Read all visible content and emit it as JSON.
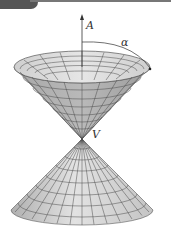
{
  "figure": {
    "labels": {
      "axis": "A",
      "angle": "α",
      "vertex": "V"
    },
    "colors": {
      "surface_light": "#d9d9d9",
      "surface_mid": "#bdbdbd",
      "surface_dark": "#9a9a9a",
      "gridline": "#4a4a4a",
      "axis": "#333333",
      "header_tab": "#555555"
    },
    "upper_nappe": {
      "rim_center": [
        82,
        67
      ],
      "rim_rx": 68,
      "rim_ry": 16
    },
    "vertex_point": [
      82,
      139
    ],
    "lower_nappe": {
      "base_center": [
        82,
        210
      ],
      "base_rx": 71,
      "base_ry": 15
    },
    "axis_arrow": {
      "x": 82,
      "y_top": 15
    }
  }
}
